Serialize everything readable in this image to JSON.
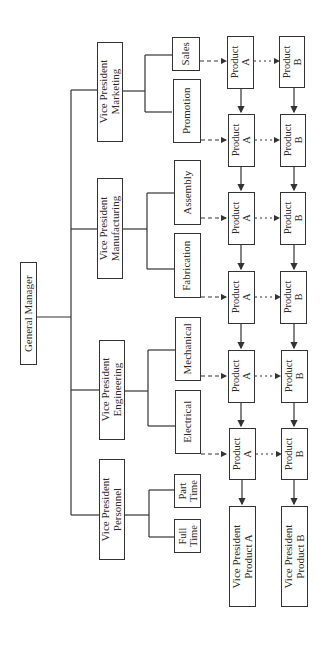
{
  "diagram": {
    "type": "organization-chart",
    "orientation": "rotated-90-ccw",
    "root": {
      "id": "gm",
      "label": "General Manager"
    },
    "vice_presidents": [
      {
        "id": "vp-marketing",
        "line1": "Vice President",
        "line2": "Marketing",
        "departments": [
          {
            "id": "sales",
            "line1": "Sales",
            "line2": ""
          },
          {
            "id": "promotion",
            "line1": "Promotion",
            "line2": ""
          }
        ]
      },
      {
        "id": "vp-manufacturing",
        "line1": "Vice President",
        "line2": "Manufacturing",
        "departments": [
          {
            "id": "assembly",
            "line1": "Assembly",
            "line2": ""
          },
          {
            "id": "fabrication",
            "line1": "Fabrication",
            "line2": ""
          }
        ]
      },
      {
        "id": "vp-engineering",
        "line1": "Vice President",
        "line2": "Engineering",
        "departments": [
          {
            "id": "mechanical",
            "line1": "Mechanical",
            "line2": ""
          },
          {
            "id": "electrical",
            "line1": "Electrical",
            "line2": ""
          }
        ]
      },
      {
        "id": "vp-personnel",
        "line1": "Vice President",
        "line2": "Personnel",
        "departments": [
          {
            "id": "part-time",
            "line1": "Part",
            "line2": "Time"
          },
          {
            "id": "full-time",
            "line1": "Full",
            "line2": "Time"
          }
        ]
      }
    ],
    "product_cells": {
      "product_a": {
        "line1": "Product",
        "line2": "A"
      },
      "product_b": {
        "line1": "Product",
        "line2": "B"
      }
    },
    "product_rows": [
      "Sales",
      "Promotion",
      "Assembly",
      "Fabrication",
      "Mechanical",
      "Electrical"
    ],
    "product_vps": [
      {
        "id": "vp-product-a",
        "line1": "Vice President",
        "line2": "Product A"
      },
      {
        "id": "vp-product-b",
        "line1": "Vice President",
        "line2": "Product B"
      }
    ],
    "colors": {
      "line": "#333333",
      "background": "#ffffff",
      "text": "#2a2a2a"
    }
  }
}
